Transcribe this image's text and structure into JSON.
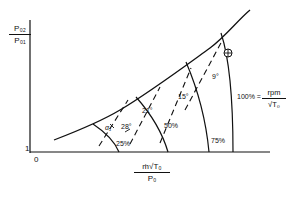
{
  "diagram": {
    "y_axis": {
      "numerator": "P₀₂",
      "denominator": "P₀₁",
      "origin_tick": "1"
    },
    "x_axis": {
      "numerator": "ṁ√T₀",
      "denominator": "P₀",
      "origin": "0"
    },
    "speed_lines": [
      {
        "label": "25%"
      },
      {
        "label": "50%"
      },
      {
        "label": "75%"
      },
      {
        "label": "100% = rpm / √T₀"
      }
    ],
    "speed_100": {
      "prefix": "100% =",
      "numerator": "rpm",
      "denominator": "√T₀"
    },
    "incidence_lines": [
      {
        "label": "28°"
      },
      {
        "label": "21°"
      },
      {
        "label": "15°"
      },
      {
        "label": "9°"
      }
    ],
    "alpha_label": "α₁",
    "design_point_marker": "⊕",
    "colors": {
      "line": "#111111",
      "background": "#ffffff"
    }
  }
}
